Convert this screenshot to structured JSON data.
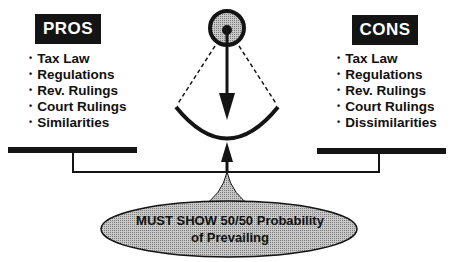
{
  "pros": {
    "header": "PROS",
    "items": [
      "Tax Law",
      "Regulations",
      "Rev. Rulings",
      "Court Rulings",
      "Similarities"
    ]
  },
  "cons": {
    "header": "CONS",
    "items": [
      "Tax Law",
      "Regulations",
      "Rev. Rulings",
      "Court Rulings",
      "Dissimilarities"
    ]
  },
  "fulcrum": {
    "line1": "MUST SHOW 50/50 Probability",
    "line2": "of Prevailing"
  },
  "colors": {
    "ink": "#141414",
    "fill_gray": "#a8a8a8",
    "background": "#ffffff"
  }
}
